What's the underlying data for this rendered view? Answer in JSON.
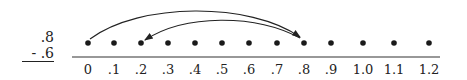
{
  "problem": {
    "minuend": ".8",
    "subtrahend": "- .6"
  },
  "number_line": {
    "ticks": [
      "0",
      ".1",
      ".2",
      ".3",
      ".4",
      ".5",
      ".6",
      ".7",
      ".8",
      ".9",
      "1.0",
      "1.1",
      "1.2"
    ],
    "tick_x": [
      88,
      114,
      141,
      168,
      195,
      222,
      249,
      277,
      304,
      331,
      363,
      394,
      429
    ],
    "arrows": [
      {
        "from": "0",
        "to": ".8",
        "label": "forward jump of .8"
      },
      {
        "from": ".8",
        "to": ".2",
        "label": "backward jump of .6"
      }
    ],
    "dot_color": "#1a1a1a",
    "line_color": "#333333"
  }
}
